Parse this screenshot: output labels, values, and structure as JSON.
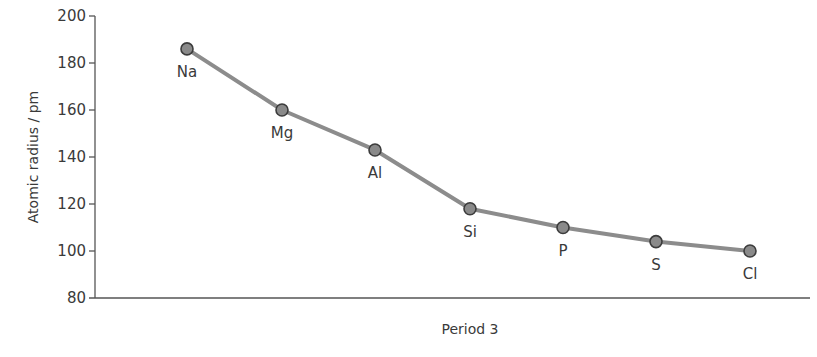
{
  "chart_data": {
    "type": "line",
    "title": "",
    "xlabel": "Period 3",
    "ylabel": "Atomic radius / pm",
    "ylim": [
      80,
      200
    ],
    "yticks": [
      80,
      100,
      120,
      140,
      160,
      180,
      200
    ],
    "grid": false,
    "legend": null,
    "categories": [
      "Na",
      "Mg",
      "Al",
      "Si",
      "P",
      "S",
      "Cl"
    ],
    "series": [
      {
        "name": "Atomic radius",
        "values": [
          186,
          160,
          143,
          118,
          110,
          104,
          100
        ]
      }
    ],
    "colors": {
      "line": "#8c8c8c",
      "marker_fill": "#8a8a8a",
      "marker_stroke": "#3c3c3c",
      "axis": "#555555"
    }
  }
}
